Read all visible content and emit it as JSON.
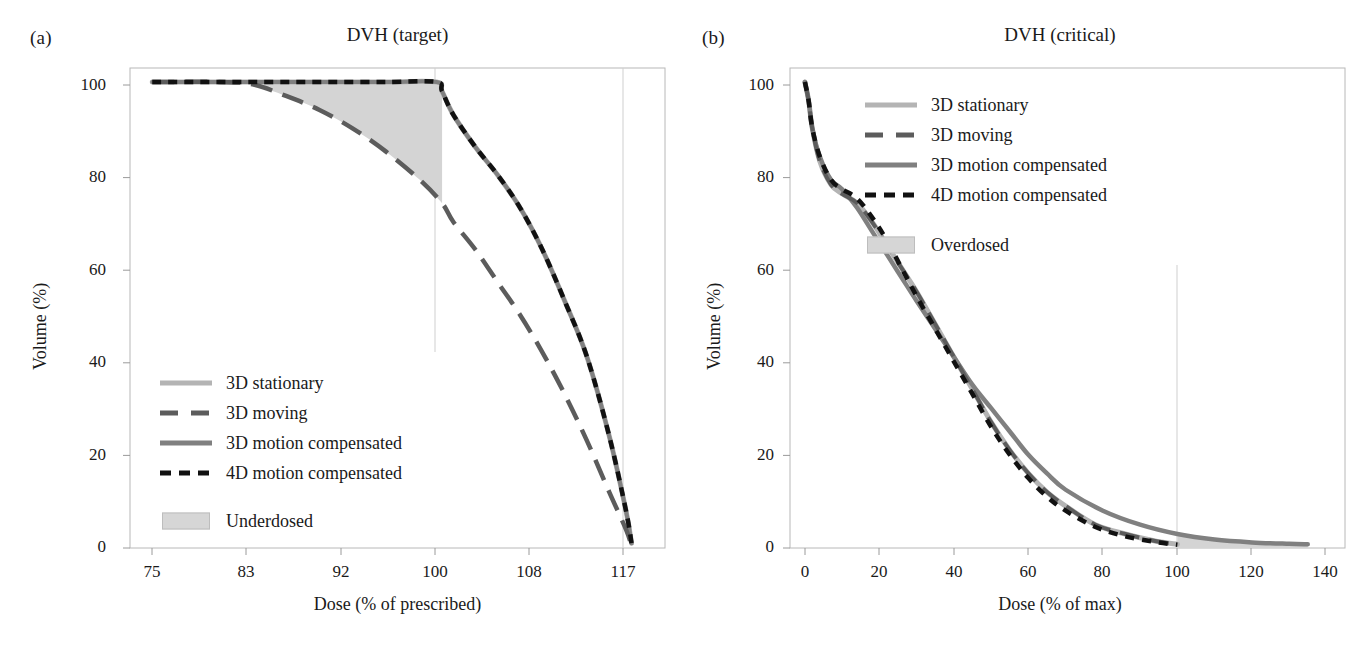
{
  "figure": {
    "background": "#ffffff",
    "colors": {
      "stationary": "#b4b4b4",
      "moving": "#5c5c5c",
      "motion3d": "#808080",
      "motion4d": "#111111",
      "shade": "#d4d4d4",
      "frame": "#b0b0b0",
      "grid": "#cccccc",
      "text": "#1a1a1a"
    }
  },
  "panels": [
    {
      "label": "(a)",
      "title": "DVH (target)",
      "legend": {
        "entries": [
          {
            "label": "3D stationary",
            "style": "solid-light"
          },
          {
            "label": "3D moving",
            "style": "long-dash"
          },
          {
            "label": "3D motion compensated",
            "style": "solid-gray"
          },
          {
            "label": "4D motion compensated",
            "style": "short-dash"
          }
        ],
        "area": {
          "label": "Underdosed",
          "style": "shaded-box"
        }
      }
    },
    {
      "label": "(b)",
      "title": "DVH (critical)",
      "legend": {
        "entries": [
          {
            "label": "3D stationary",
            "style": "solid-light"
          },
          {
            "label": "3D moving",
            "style": "long-dash"
          },
          {
            "label": "3D motion compensated",
            "style": "solid-gray"
          },
          {
            "label": "4D motion compensated",
            "style": "short-dash"
          }
        ],
        "area": {
          "label": "Overdosed",
          "style": "shaded-box"
        }
      }
    }
  ],
  "chart_data": [
    {
      "type": "line",
      "title": "DVH (target)",
      "panel_label": "(a)",
      "xlabel": "Dose (% of prescribed)",
      "ylabel": "Volume (%)",
      "xlim": [
        72,
        120
      ],
      "ylim": [
        0,
        103
      ],
      "xticks": [
        75,
        83,
        92,
        100,
        108,
        117
      ],
      "yticks": [
        0,
        20,
        40,
        60,
        80,
        100
      ],
      "grid": "vertical-at-100-and-117",
      "legend_position": "lower-left-inside",
      "shaded_region": {
        "name": "Underdosed",
        "color": "#d4d4d4",
        "upper_series": "3D stationary",
        "lower_series": "3D moving",
        "x_range": [
          82,
          100
        ]
      },
      "series": [
        {
          "name": "3D stationary",
          "style": "solid-light",
          "color": "#b4b4b4",
          "x": [
            74,
            80,
            85,
            90,
            95,
            99.5,
            100,
            101,
            103,
            105,
            107,
            109,
            111,
            113,
            115,
            116.5,
            117
          ],
          "y": [
            100,
            100,
            100,
            100,
            100,
            100,
            98,
            93,
            86,
            80,
            73,
            64,
            53,
            41,
            24,
            8,
            1
          ]
        },
        {
          "name": "3D moving",
          "style": "long-dash",
          "color": "#5c5c5c",
          "x": [
            74,
            80,
            83,
            86,
            89,
            92,
            95,
            98,
            100,
            101,
            103,
            105,
            107,
            109,
            111,
            113,
            115,
            116.5,
            117
          ],
          "y": [
            100,
            100,
            99.5,
            97,
            94,
            90,
            85,
            79,
            74,
            70,
            64,
            57,
            50,
            42,
            33,
            23,
            12,
            4,
            0.5
          ]
        },
        {
          "name": "3D motion compensated",
          "style": "solid-gray",
          "color": "#808080",
          "x": [
            74,
            80,
            85,
            90,
            95,
            99.5,
            100,
            101,
            103,
            105,
            107,
            109,
            111,
            113,
            115,
            116.5,
            117
          ],
          "y": [
            100,
            100,
            100,
            100,
            100,
            100,
            98,
            93,
            86,
            80,
            73,
            64,
            53,
            41,
            24,
            8,
            1
          ]
        },
        {
          "name": "4D motion compensated",
          "style": "short-dash",
          "color": "#111111",
          "x": [
            74,
            80,
            85,
            90,
            95,
            99.5,
            100,
            101,
            103,
            105,
            107,
            109,
            111,
            113,
            115,
            116.5,
            117
          ],
          "y": [
            100,
            100,
            100,
            100,
            100,
            100,
            98,
            93,
            86,
            80,
            73,
            64,
            53,
            41,
            24,
            8,
            1
          ]
        }
      ]
    },
    {
      "type": "line",
      "title": "DVH (critical)",
      "panel_label": "(b)",
      "xlabel": "Dose (% of max)",
      "ylabel": "Volume (%)",
      "xlim": [
        -4,
        145
      ],
      "ylim": [
        0,
        103
      ],
      "xticks": [
        0,
        20,
        40,
        60,
        80,
        100,
        120,
        140
      ],
      "yticks": [
        0,
        20,
        40,
        60,
        80,
        100
      ],
      "grid": "vertical-at-100",
      "legend_position": "upper-right-inside",
      "shaded_region": {
        "name": "Overdosed",
        "color": "#d4d4d4",
        "upper_series": "3D motion compensated",
        "lower_series": "4D motion compensated",
        "x_range": [
          100,
          135
        ]
      },
      "series": [
        {
          "name": "3D stationary",
          "style": "solid-light",
          "color": "#b4b4b4",
          "x": [
            0,
            1,
            2,
            4,
            7,
            10,
            14,
            18,
            22,
            26,
            30,
            35,
            40,
            45,
            50,
            55,
            60,
            65,
            70,
            78,
            86,
            94,
            100
          ],
          "y": [
            100,
            96,
            90,
            83,
            78,
            76,
            74,
            70,
            65,
            60,
            55,
            48,
            41,
            34,
            27,
            21,
            16,
            12,
            9,
            5,
            3,
            1.5,
            0.8
          ]
        },
        {
          "name": "3D moving",
          "style": "long-dash",
          "color": "#5c5c5c",
          "x": [
            0,
            1,
            2,
            4,
            7,
            10,
            14,
            18,
            22,
            26,
            30,
            35,
            40,
            45,
            50,
            55,
            60,
            65,
            70,
            78,
            86,
            94,
            100
          ],
          "y": [
            100,
            96,
            90,
            83,
            78,
            76,
            74,
            70,
            65,
            60,
            55,
            48,
            41,
            34,
            27,
            21,
            16,
            12,
            9,
            5,
            3,
            1.5,
            0.8
          ]
        },
        {
          "name": "3D motion compensated",
          "style": "solid-gray",
          "color": "#808080",
          "x": [
            0,
            1,
            2,
            4,
            7,
            10,
            14,
            18,
            22,
            26,
            30,
            35,
            40,
            45,
            50,
            55,
            60,
            65,
            70,
            80,
            90,
            100,
            110,
            120,
            130,
            135
          ],
          "y": [
            100,
            96,
            90,
            84,
            79,
            77,
            73,
            68,
            63,
            58,
            53,
            47,
            41,
            35,
            30,
            25,
            20,
            16,
            12.5,
            8,
            5,
            3,
            1.8,
            1.2,
            0.9,
            0.8
          ]
        },
        {
          "name": "4D motion compensated",
          "style": "short-dash",
          "color": "#111111",
          "x": [
            0,
            1,
            2,
            4,
            7,
            10,
            14,
            18,
            22,
            26,
            30,
            35,
            40,
            45,
            50,
            55,
            60,
            65,
            70,
            78,
            86,
            94,
            100
          ],
          "y": [
            100,
            96,
            90,
            84,
            79,
            77,
            75,
            71,
            66,
            60,
            54,
            47,
            40,
            33,
            26,
            20,
            15,
            11,
            8,
            4.5,
            2.5,
            1.3,
            0.7
          ]
        }
      ]
    }
  ]
}
